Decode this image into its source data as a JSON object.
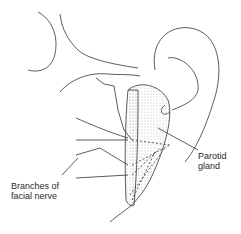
{
  "figure": {
    "labels": {
      "parotid": {
        "line1": "Parotid",
        "line2": "gland"
      },
      "nerve": {
        "line1": "Branches of",
        "line2": "facial nerve"
      }
    },
    "colors": {
      "stroke": "#333333",
      "stipple": "#bdbdbd",
      "background": "#ffffff"
    }
  }
}
